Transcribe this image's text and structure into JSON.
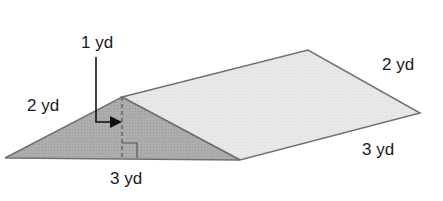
{
  "figure": {
    "type": "triangular-prism",
    "colors": {
      "front_face": "#a9a9a9",
      "top_face": "#e6e6e6",
      "edge": "#6e6e6e",
      "text": "#1a1a1a"
    },
    "labels": {
      "height": "1 yd",
      "slant_side": "2 yd",
      "base": "3 yd",
      "back_slant": "2 yd",
      "length": "3 yd"
    },
    "annotations": {
      "height_marker": "dashed altitude with right-angle mark",
      "arrow": "points from height label to altitude"
    }
  }
}
